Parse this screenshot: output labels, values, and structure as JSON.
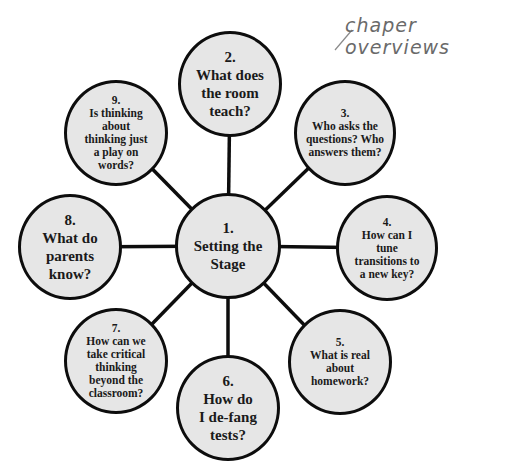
{
  "annotation": {
    "text": "chaper overviews"
  },
  "center": {
    "number": "1.",
    "label": "Setting the Stage"
  },
  "nodes": [
    {
      "number": "2.",
      "label": "What does the room teach?"
    },
    {
      "number": "3.",
      "label": "Who asks the questions? Who answers them?"
    },
    {
      "number": "4.",
      "label": "How can I tune transitions to a new key?"
    },
    {
      "number": "5.",
      "label": "What is real about homework?"
    },
    {
      "number": "6.",
      "label": "How do I de-fang tests?"
    },
    {
      "number": "7.",
      "label": "How can we take critical thinking beyond the classroom?"
    },
    {
      "number": "8.",
      "label": "What do parents know?"
    },
    {
      "number": "9.",
      "label": "Is thinking about thinking just a play on words?"
    }
  ],
  "colors": {
    "node_fill": "#e6e6e6",
    "stroke": "#0d0d0d",
    "annotation": "#6a6a6a"
  }
}
